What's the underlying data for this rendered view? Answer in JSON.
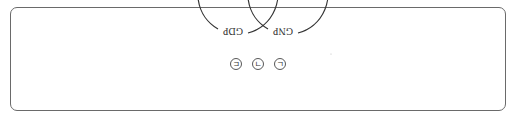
{
  "diagram": {
    "type": "venn",
    "orientation": "rotated-180",
    "sets": [
      {
        "name": "GDP"
      },
      {
        "name": "GNP"
      }
    ],
    "regions": [
      {
        "label": "ㄷ",
        "position": "left-only (displayed)"
      },
      {
        "label": "ㄱ",
        "position": "intersection"
      },
      {
        "label": "ㄴ",
        "position": "right-only (displayed)"
      }
    ]
  }
}
